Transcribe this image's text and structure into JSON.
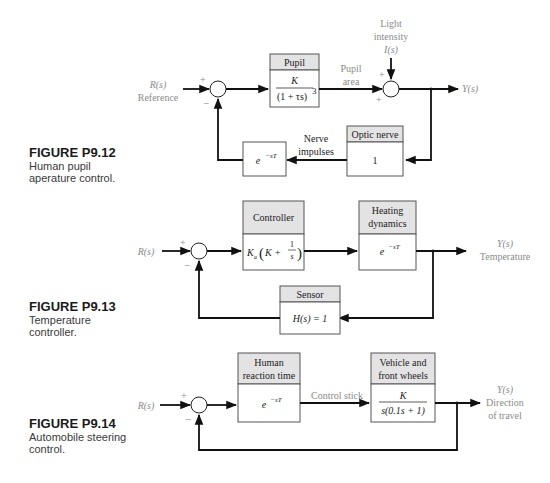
{
  "figures": [
    {
      "id": "P9.12",
      "caption": {
        "title": "FIGURE P9.12",
        "line1": "Human pupil",
        "line2": "aperature control."
      },
      "input": {
        "symbol": "R(s)",
        "label": "Reference"
      },
      "summing_junction_1": {
        "plus": "+",
        "minus": "−"
      },
      "blocks": [
        {
          "name": "pupil",
          "title": "Pupil",
          "tf_numerator": "K",
          "tf_denominator": "(1 + τs)",
          "tf_exponent": "3"
        },
        {
          "name": "optic-nerve",
          "title": "Optic nerve",
          "tf": "1"
        },
        {
          "name": "delay",
          "tf_base": "e",
          "tf_exponent": "−sT"
        }
      ],
      "signals": {
        "pupil_area_1": "Pupil",
        "pupil_area_2": "area",
        "nerve_1": "Nerve",
        "nerve_2": "impulses"
      },
      "disturbance": {
        "line1": "Light",
        "line2": "intensity",
        "symbol": "I(s)"
      },
      "summing_junction_2": {
        "plus_top": "+",
        "plus_left": "+"
      },
      "output": {
        "symbol": "Y(s)"
      }
    },
    {
      "id": "P9.13",
      "caption": {
        "title": "FIGURE P9.13",
        "line1": "Temperature",
        "line2": "controller."
      },
      "input": {
        "symbol": "R(s)"
      },
      "summing_junction_1": {
        "plus": "+",
        "minus": "−"
      },
      "blocks": [
        {
          "name": "controller",
          "title": "Controller",
          "tf_gain": "K",
          "tf_gain_sub": "a",
          "tf_inner": "K +",
          "tf_frac_num": "1",
          "tf_frac_den": "s"
        },
        {
          "name": "heating-dynamics",
          "title_1": "Heating",
          "title_2": "dynamics",
          "tf_base": "e",
          "tf_exponent": "−sT"
        },
        {
          "name": "sensor",
          "title": "Sensor",
          "tf": "H(s) = 1"
        }
      ],
      "output": {
        "symbol": "Y(s)",
        "label": "Temperature"
      }
    },
    {
      "id": "P9.14",
      "caption": {
        "title": "FIGURE P9.14",
        "line1": "Automobile steering",
        "line2": "control."
      },
      "input": {
        "symbol": "R(s)"
      },
      "summing_junction_1": {
        "plus": "+",
        "minus": "−"
      },
      "blocks": [
        {
          "name": "human-reaction-time",
          "title_1": "Human",
          "title_2": "reaction time",
          "tf_base": "e",
          "tf_exponent": "−sT"
        },
        {
          "name": "vehicle-front-wheels",
          "title_1": "Vehicle and",
          "title_2": "front wheels",
          "tf_numerator": "K",
          "tf_denominator": "s(0.1s + 1)"
        }
      ],
      "signals": {
        "control_stick": "Control stick"
      },
      "output": {
        "symbol": "Y(s)",
        "label_1": "Direction",
        "label_2": "of travel"
      }
    }
  ]
}
